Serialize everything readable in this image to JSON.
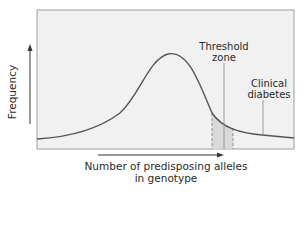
{
  "figure": {
    "y_axis_label": "Frequency",
    "x_axis_label_line1": "Number of predisposing alleles",
    "x_axis_label_line2": "in genotype",
    "annotations": {
      "threshold_line1": "Threshold",
      "threshold_line2": "zone",
      "clinical_line1": "Clinical",
      "clinical_line2": "diabetes"
    },
    "colors": {
      "panel_bg": "#f1f1f1",
      "panel_border": "#9a9a9a",
      "curve": "#555555",
      "threshold_fill": "#dcdcdc",
      "text": "#2a2a2a"
    }
  }
}
